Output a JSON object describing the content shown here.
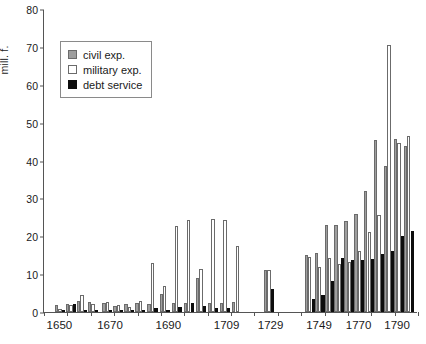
{
  "chart_data": {
    "type": "bar",
    "title": "",
    "xlabel": "",
    "ylabel": "mill. f.",
    "ylim": [
      0,
      80
    ],
    "ytick_step": 10,
    "yticks": [
      "0",
      "10",
      "20",
      "30",
      "40",
      "50",
      "60",
      "70",
      "80"
    ],
    "xticks": [
      "1650",
      "1670",
      "1690",
      "1709",
      "1729",
      "1749",
      "1770",
      "1790"
    ],
    "grid": false,
    "legend_position": "upper-left-inside",
    "legend": [
      "civil exp.",
      "military exp.",
      "debt service"
    ],
    "colors": {
      "civil": "#9e9e9e",
      "military": "#ffffff",
      "debt": "#0d0d0d",
      "outline": "#6b6b6b",
      "axis": "#555555",
      "text": "#1a1a1a"
    },
    "series": [
      {
        "name": "civil exp.",
        "key": "civil"
      },
      {
        "name": "military exp.",
        "key": "military"
      },
      {
        "name": "debt service",
        "key": "debt"
      }
    ],
    "categories": [
      "1650",
      "1655",
      "1660",
      "1665",
      "1670",
      "1675",
      "1680",
      "1685",
      "1690",
      "1695",
      "1700",
      "1709",
      "1715",
      "1729",
      "1749",
      "1755",
      "1760",
      "1765",
      "1770",
      "1775",
      "1780",
      "1785",
      "1790",
      "1795"
    ],
    "groups": [
      {
        "label": "1650",
        "x": 1.0,
        "civil": 1.8,
        "military": 0.9,
        "debt": 0.4
      },
      {
        "label": "1652",
        "x": 2.0,
        "civil": 2.1,
        "military": 1.9,
        "debt": 2.0
      },
      {
        "label": "1655",
        "x": 3.0,
        "civil": 2.8,
        "military": 4.4,
        "debt": 0.5
      },
      {
        "label": "1658",
        "x": 4.0,
        "civil": 2.6,
        "military": 2.2,
        "debt": 0.4
      },
      {
        "label": "1665",
        "x": 5.3,
        "civil": 2.4,
        "military": 2.6,
        "debt": 0.4
      },
      {
        "label": "1668",
        "x": 6.3,
        "civil": 1.5,
        "military": 1.9,
        "debt": 0.5
      },
      {
        "label": "1671",
        "x": 7.3,
        "civil": 2.2,
        "military": 1.2,
        "debt": 0.4
      },
      {
        "label": "1675",
        "x": 8.3,
        "civil": 2.4,
        "military": 2.8,
        "debt": 0.5
      },
      {
        "label": "1680",
        "x": 9.4,
        "civil": 2.1,
        "military": 13.0,
        "debt": 1.1
      },
      {
        "label": "1685",
        "x": 10.5,
        "civil": 4.8,
        "military": 6.9,
        "debt": 0.6
      },
      {
        "label": "1690",
        "x": 11.6,
        "civil": 2.3,
        "military": 22.8,
        "debt": 1.2
      },
      {
        "label": "1695",
        "x": 12.7,
        "civil": 2.4,
        "military": 24.4,
        "debt": 2.3
      },
      {
        "label": "1700",
        "x": 13.8,
        "civil": 8.9,
        "military": 11.4,
        "debt": 1.6
      },
      {
        "label": "1705",
        "x": 14.9,
        "civil": 2.5,
        "military": 24.6,
        "debt": 1.1
      },
      {
        "label": "1709",
        "x": 16.0,
        "civil": 2.5,
        "military": 24.4,
        "debt": 1.0
      },
      {
        "label": "1712",
        "x": 17.1,
        "civil": 2.6,
        "military": 17.5,
        "debt": 0.0
      },
      {
        "label": "1729",
        "x": 20.0,
        "civil": 11.0,
        "military": 11.0,
        "debt": 6.0
      },
      {
        "label": "1749",
        "x": 23.7,
        "civil": 15.0,
        "military": 14.5,
        "debt": 3.5
      },
      {
        "label": "1752",
        "x": 24.6,
        "civil": 15.5,
        "military": 12.0,
        "debt": 4.4
      },
      {
        "label": "1755",
        "x": 25.5,
        "civil": 23.0,
        "military": 14.2,
        "debt": 8.3
      },
      {
        "label": "1760",
        "x": 26.4,
        "civil": 23.0,
        "military": 12.8,
        "debt": 14.3
      },
      {
        "label": "1765",
        "x": 27.3,
        "civil": 24.0,
        "military": 13.2,
        "debt": 13.7
      },
      {
        "label": "1770",
        "x": 28.2,
        "civil": 26.0,
        "military": 16.2,
        "debt": 13.8
      },
      {
        "label": "1775",
        "x": 29.1,
        "civil": 32.0,
        "military": 21.2,
        "debt": 14.0
      },
      {
        "label": "1780",
        "x": 30.0,
        "civil": 45.5,
        "military": 25.5,
        "debt": 15.2
      },
      {
        "label": "1785",
        "x": 30.9,
        "civil": 38.5,
        "military": 70.5,
        "debt": 16.0
      },
      {
        "label": "1790",
        "x": 31.8,
        "civil": 45.8,
        "military": 44.5,
        "debt": 20.0
      },
      {
        "label": "1795",
        "x": 32.7,
        "civil": 43.8,
        "military": 46.6,
        "debt": 21.3
      }
    ]
  }
}
